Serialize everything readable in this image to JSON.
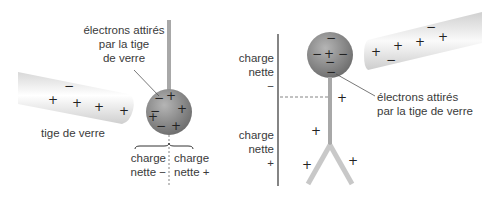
{
  "left_panel": {
    "label_electrons": [
      "électrons attirés",
      "par la tige",
      "de verre"
    ],
    "label_rod": "tige de verre",
    "label_charge_left": [
      "charge",
      "nette −"
    ],
    "label_charge_right": [
      "charge",
      "nette +"
    ]
  },
  "right_panel": {
    "label_charge_top": [
      "charge",
      "nette",
      "−"
    ],
    "label_charge_bottom": [
      "charge",
      "nette",
      "+"
    ],
    "label_electrons": [
      "électrons attirés",
      "par la tige de verre"
    ]
  },
  "colors": {
    "sphere": "#8f8f8f",
    "rod": "#e6e6e6",
    "stem": "#a8a8a8",
    "text": "#3a3a3a"
  }
}
